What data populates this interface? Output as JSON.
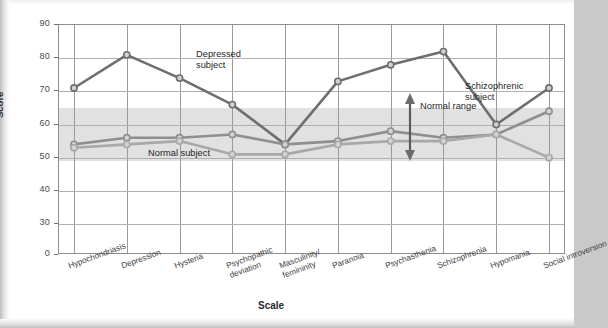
{
  "chart_data": {
    "type": "line",
    "title": "",
    "xlabel": "Scale",
    "ylabel": "Score",
    "ylim": [
      0,
      90
    ],
    "y_ticks": [
      90,
      80,
      70,
      60,
      50,
      40,
      30,
      0
    ],
    "y_axis_break_between": [
      30,
      0
    ],
    "grid": true,
    "legend_position": "inline-annotations",
    "categories": [
      "Hypochondriasis",
      "Depression",
      "Hysteria",
      "Psychopathic deviation",
      "Masculinity/femininity",
      "Paranoia",
      "Psychasthenia",
      "Schizophrenia",
      "Hypomania",
      "Social introversion"
    ],
    "series": [
      {
        "name": "Depressed subject",
        "color": "#6e6e6e",
        "values": [
          71,
          81,
          74,
          66,
          54,
          73,
          78,
          82,
          60,
          71
        ]
      },
      {
        "name": "Schizophrenic subject",
        "color": "#8f8f8f",
        "values": [
          54,
          56,
          56,
          57,
          54,
          55,
          58,
          56,
          57,
          64
        ]
      },
      {
        "name": "Normal subject",
        "color": "#a8a8a8",
        "values": [
          53,
          54,
          55,
          51,
          51,
          54,
          55,
          55,
          57,
          50
        ]
      }
    ],
    "shaded_region": {
      "label": "Normal range",
      "from": 49,
      "to": 65,
      "color": "#d9d9d9"
    },
    "annotations": [
      {
        "name": "depressed-subject-label",
        "text_line1": "Depressed",
        "text_line2": "subject"
      },
      {
        "name": "schizophrenic-subject-label",
        "text_line1": "Schizophrenic",
        "text_line2": "subject"
      },
      {
        "name": "normal-subject-label",
        "text_line1": "Normal subject",
        "text_line2": ""
      },
      {
        "name": "normal-range-label",
        "text_line1": "Normal range",
        "text_line2": ""
      }
    ]
  },
  "axis": {
    "y_label": "Score",
    "x_label": "Scale",
    "y_ticks": [
      "90",
      "80",
      "70",
      "60",
      "50",
      "40",
      "30",
      "0"
    ],
    "x_ticks": [
      {
        "line1": "Hypochondriasis",
        "line2": ""
      },
      {
        "line1": "Depression",
        "line2": ""
      },
      {
        "line1": "Hysteria",
        "line2": ""
      },
      {
        "line1": "Psychopathic",
        "line2": "deviation"
      },
      {
        "line1": "Masculinity/",
        "line2": "femininity"
      },
      {
        "line1": "Paranoia",
        "line2": ""
      },
      {
        "line1": "Psychasthenia",
        "line2": ""
      },
      {
        "line1": "Schizophrenia",
        "line2": ""
      },
      {
        "line1": "Hypomania",
        "line2": ""
      },
      {
        "line1": "Social introversion",
        "line2": ""
      }
    ]
  },
  "annotations": {
    "depressed_line1": "Depressed",
    "depressed_line2": "subject",
    "schizophrenic_line1": "Schizophrenic",
    "schizophrenic_line2": "subject",
    "normal_subject": "Normal subject",
    "normal_range": "Normal range"
  },
  "colors": {
    "depressed": "#6e6e6e",
    "schizophrenic": "#8f8f8f",
    "normal": "#a8a8a8",
    "band": "#d9d9d9",
    "grid": "#9a9a9a",
    "axis": "#8d8d8d"
  }
}
